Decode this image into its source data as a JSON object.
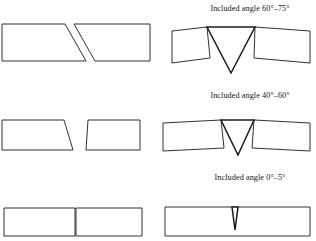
{
  "figure": {
    "stroke_color": "#1a1a1a",
    "fill_color": "#ffffff",
    "background_color": "#ffffff"
  },
  "rows": [
    {
      "id": "row-1",
      "caption": "Included angle 60°–75°",
      "angle_min_deg": 60,
      "angle_max_deg": 75,
      "left_figure": {
        "name": "beveled-plate-pair-wide",
        "description": "Two plates with wide bevels separated by a gap",
        "plate_left_points": "2,24 65,24 86,61 2,61",
        "plate_right_points": "95,61 74,24 150,24 150,61"
      },
      "right_figure": {
        "name": "v-groove-joint-wide",
        "description": "Assembled V-groove joint with wide included angle",
        "plate_left_points": "172,31 207,27 210,58 172,63",
        "plate_right_points": "255,27 310,31 310,63 254,58",
        "groove_points": "207,27 255,27 231,73",
        "apex_x": 231,
        "apex_y": 73
      }
    },
    {
      "id": "row-2",
      "caption": "Included angle 40°–60°",
      "angle_min_deg": 40,
      "angle_max_deg": 60,
      "left_figure": {
        "name": "beveled-plate-pair-narrow",
        "description": "Two plates with steeper narrow bevels separated by a gap",
        "plate_left_points": "2,120 64,120 73,150 2,150",
        "plate_right_points": "86,150 88,120 140,120 140,150"
      },
      "right_figure": {
        "name": "v-groove-joint-narrow",
        "description": "Assembled V-groove joint with medium included angle",
        "plate_left_points": "163,123 221,120 224,148 163,151",
        "plate_right_points": "254,120 310,123 310,151 252,148",
        "groove_points": "221,120 254,120 238,155",
        "apex_x": 238,
        "apex_y": 155
      }
    },
    {
      "id": "row-3",
      "caption": "Included angle 0°–5°",
      "angle_min_deg": 0,
      "angle_max_deg": 5,
      "left_figure": {
        "name": "square-edge-plate-pair",
        "description": "Two square-edge plates butted together at a seam",
        "plate_left_points": "4,208 75,208 75,236 4,236",
        "plate_right_points": "76,208 142,208 142,236 76,236",
        "seam_x": 75.5
      },
      "right_figure": {
        "name": "square-butt-joint-slit",
        "description": "Closed square butt joint with a very narrow tapered slit",
        "plate_points": "165,207 310,207 310,236 165,236",
        "groove_points": "232,207 238,207 235,230",
        "apex_x": 235,
        "apex_y": 230
      }
    }
  ]
}
